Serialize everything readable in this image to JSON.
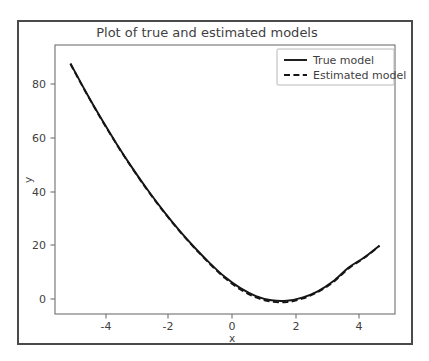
{
  "chart_data": {
    "type": "line",
    "title": "Plot of true and estimated models",
    "xlabel": "x",
    "ylabel": "y",
    "xlim": [
      -5.5,
      5.5
    ],
    "ylim": [
      -5,
      97
    ],
    "xticks": [
      "-4",
      "-2",
      "0",
      "2",
      "4"
    ],
    "xtick_values": [
      -4,
      -2,
      0,
      2,
      4
    ],
    "yticks": [
      "0",
      "20",
      "40",
      "60",
      "80"
    ],
    "ytick_values": [
      0,
      20,
      40,
      60,
      80
    ],
    "grid": false,
    "legend_position": "upper right",
    "series": [
      {
        "name": "True model",
        "style": "solid",
        "color": "#151515",
        "x": [
          -5.0,
          -4.5,
          -4.0,
          -3.5,
          -3.0,
          -2.5,
          -2.0,
          -1.5,
          -1.0,
          -0.5,
          0.0,
          0.5,
          1.0,
          1.5,
          2.0,
          2.5,
          3.0,
          3.5,
          4.0,
          4.5,
          5.0
        ],
        "values": [
          90.0,
          79.2,
          69.0,
          59.4,
          50.4,
          42.0,
          34.2,
          27.0,
          20.4,
          14.4,
          9.0,
          4.8,
          1.8,
          0.2,
          0.0,
          1.2,
          3.6,
          7.4,
          12.6,
          16.4,
          21.0
        ]
      },
      {
        "name": "Estimated model",
        "style": "dashed",
        "color": "#151515",
        "x": [
          -5.0,
          -4.5,
          -4.0,
          -3.5,
          -3.0,
          -2.5,
          -2.0,
          -1.5,
          -1.0,
          -0.5,
          0.0,
          0.5,
          1.0,
          1.5,
          2.0,
          2.5,
          3.0,
          3.5,
          4.0,
          4.5,
          5.0
        ],
        "values": [
          89.8,
          79.0,
          68.8,
          59.2,
          50.2,
          41.8,
          34.0,
          26.8,
          20.2,
          14.1,
          8.6,
          4.3,
          1.3,
          -0.3,
          -0.5,
          0.8,
          3.3,
          7.1,
          12.3,
          16.2,
          20.8
        ]
      }
    ]
  },
  "legend": {
    "entries": [
      {
        "label": "True model",
        "style": "solid"
      },
      {
        "label": "Estimated model",
        "style": "dashed"
      }
    ]
  }
}
